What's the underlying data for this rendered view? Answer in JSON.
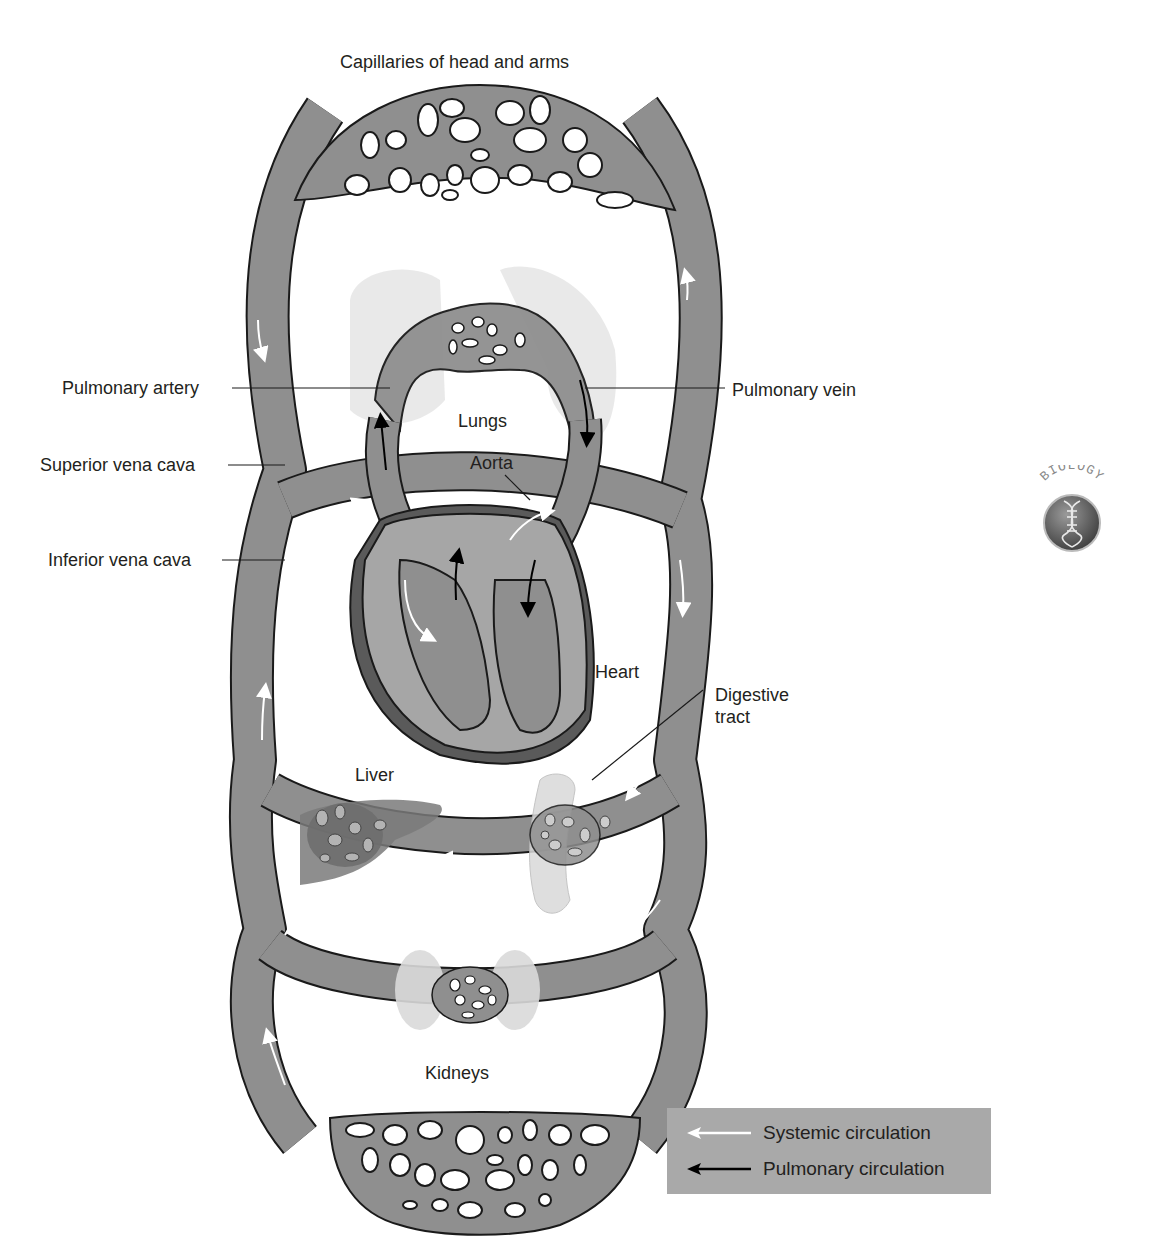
{
  "figure": {
    "title": "Capillaries of head and arms",
    "labels": {
      "pulmonary_artery": "Pulmonary artery",
      "superior_vena_cava": "Superior vena cava",
      "inferior_vena_cava": "Inferior vena cava",
      "pulmonary_vein": "Pulmonary vein",
      "lungs": "Lungs",
      "aorta": "Aorta",
      "heart": "Heart",
      "digestive_tract_line1": "Digestive",
      "digestive_tract_line2": "tract",
      "liver": "Liver",
      "kidneys": "Kidneys"
    }
  },
  "legend": {
    "items": [
      {
        "label": "Systemic circulation",
        "arrow_color": "#ffffff"
      },
      {
        "label": "Pulmonary circulation",
        "arrow_color": "#000000"
      }
    ]
  },
  "badge": {
    "text": "BIOLOGY",
    "icon": "dna-helix-icon"
  },
  "colors": {
    "vessel": "#8f8f8f",
    "vessel_outline": "#1a1a1a",
    "heart_wall": "#a6a6a6",
    "heart_dark": "#5a5a5a",
    "organ_light": "#d9d9d9",
    "legend_bg": "#a9a9a9"
  }
}
